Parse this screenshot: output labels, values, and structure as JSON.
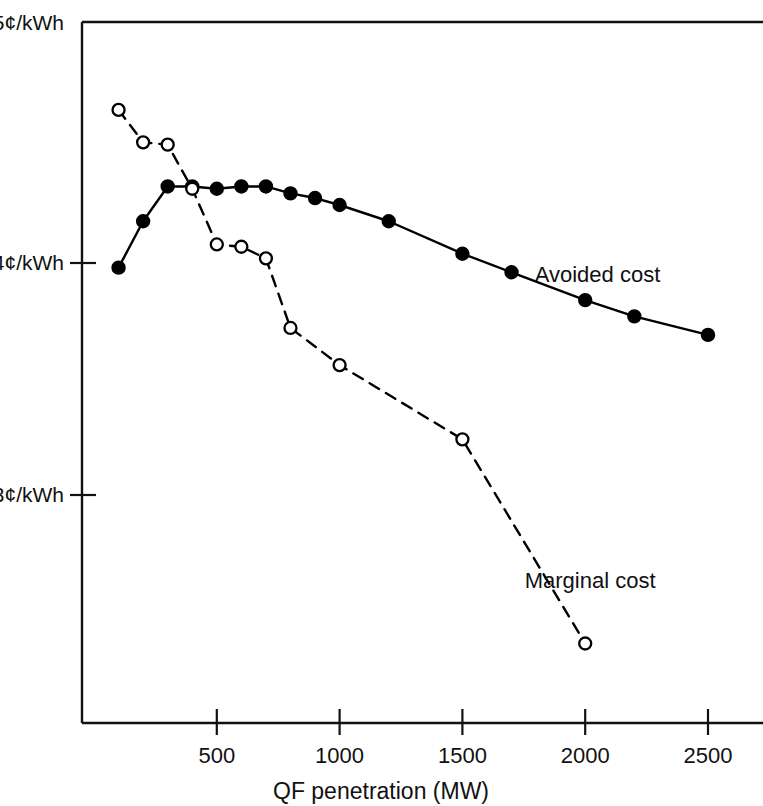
{
  "chart_data": {
    "type": "line",
    "title": "",
    "xlabel": "QF penetration (MW)",
    "ylabel": "",
    "xlim": [
      -50,
      2560
    ],
    "ylim": [
      2.1,
      5.0
    ],
    "grid": false,
    "legend_position": "inline-annotation",
    "xticks": [
      500,
      1000,
      1500,
      2000,
      2500
    ],
    "xtick_labels": [
      "500",
      "1000",
      "1500",
      "2000",
      "2500"
    ],
    "yticks": [
      3,
      4,
      5
    ],
    "ytick_labels": [
      "3¢/kWh",
      "4¢/kWh",
      "5¢/kWh"
    ],
    "units": "¢/kWh",
    "series": [
      {
        "name": "Avoided cost",
        "marker": "filled-circle",
        "line_style": "solid",
        "color": "#000000",
        "x": [
          100,
          200,
          300,
          400,
          500,
          600,
          700,
          800,
          900,
          1000,
          1200,
          1500,
          1700,
          2000,
          2200,
          2500
        ],
        "values": [
          3.98,
          4.18,
          4.33,
          4.33,
          4.32,
          4.33,
          4.33,
          4.3,
          4.28,
          4.25,
          4.18,
          4.04,
          3.96,
          3.84,
          3.77,
          3.69
        ]
      },
      {
        "name": "Marginal cost",
        "marker": "open-circle",
        "line_style": "dashed",
        "color": "#000000",
        "x": [
          100,
          200,
          300,
          400,
          500,
          600,
          700,
          800,
          1000,
          1500,
          2000
        ],
        "values": [
          4.66,
          4.52,
          4.51,
          4.32,
          4.08,
          4.07,
          4.02,
          3.72,
          3.56,
          3.24,
          2.36
        ]
      }
    ],
    "annotations": [
      {
        "text": "Avoided cost",
        "x": 2050,
        "y": 3.92
      },
      {
        "text": "Marginal cost",
        "x": 2020,
        "y": 2.6
      }
    ]
  }
}
